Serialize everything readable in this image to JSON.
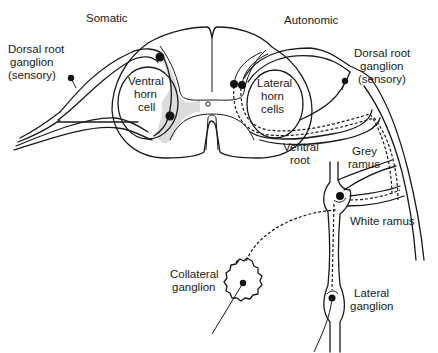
{
  "diagram": {
    "type": "anatomical-line-drawing",
    "colors": {
      "line": "#1a1a1a",
      "grey_matter": "#dcdcdc",
      "background": "#ffffff"
    },
    "headings": {
      "somatic": "Somatic",
      "autonomic": "Autonomic"
    },
    "labels": {
      "dorsal_root_left": [
        "Dorsal root",
        "ganglion",
        "(sensory)"
      ],
      "dorsal_root_right": [
        "Dorsal root",
        "ganglion",
        "(sensory)"
      ],
      "ventral_horn": [
        "Ventral",
        "horn",
        "cell"
      ],
      "lateral_horn": [
        "Lateral",
        "horn",
        "cells"
      ],
      "ventral_root": [
        "Ventral",
        "root"
      ],
      "grey_ramus": [
        "Grey",
        "ramus"
      ],
      "white_ramus": "White ramus",
      "collateral_ganglion": [
        "Collateral",
        "ganglion"
      ],
      "lateral_ganglion": [
        "Lateral",
        "ganglion"
      ]
    }
  }
}
